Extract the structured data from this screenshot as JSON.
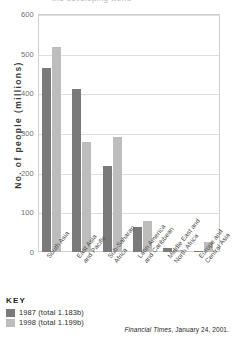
{
  "clipped_title": "the developing world",
  "source_note": {
    "publication": "Financial Times",
    "rest": ", January 24, 2001."
  },
  "legend": {
    "title": "KEY",
    "entries": [
      {
        "label": "1987 (total 1.183b)",
        "color": "#7a7a7a"
      },
      {
        "label": "1998 (total 1.199b)",
        "color": "#bdbdbd"
      }
    ]
  },
  "chart_data": {
    "type": "bar",
    "title": "",
    "xlabel": "",
    "ylabel": "No. of people (millions)",
    "ylim": [
      0,
      600
    ],
    "yticks": [
      0,
      100,
      200,
      300,
      400,
      500,
      600
    ],
    "ytick_labels": [
      "0",
      "100",
      "200",
      "300",
      "400",
      "500",
      "600"
    ],
    "grid": true,
    "legend_position": "below-left",
    "categories": [
      "South Asia",
      "East Asia and Pacific",
      "Sub-Saharan Africa",
      "Latin America and Caribbean",
      "Middle East and North Africa",
      "Europe and Central Asia"
    ],
    "series": [
      {
        "name": "1987 (total 1.183b)",
        "color": "#7a7a7a",
        "values": [
          464,
          410,
          217,
          64,
          9,
          2
        ]
      },
      {
        "name": "1998 (total 1.199b)",
        "color": "#bdbdbd",
        "values": [
          517,
          278,
          290,
          78,
          6,
          24
        ]
      }
    ]
  }
}
